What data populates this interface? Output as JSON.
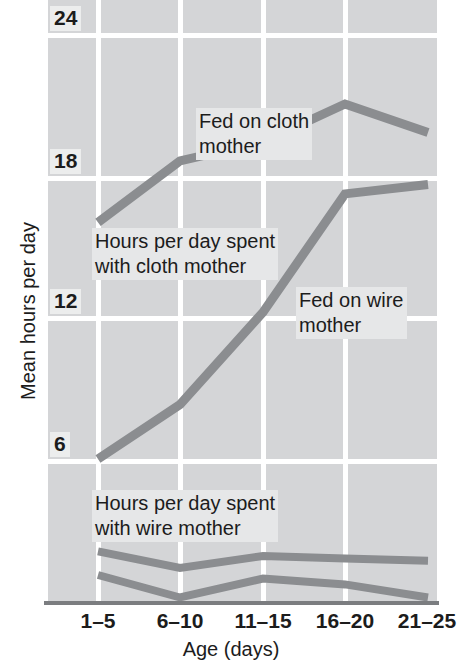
{
  "chart_data": {
    "type": "line",
    "title": "",
    "xlabel": "Age (days)",
    "ylabel": "Mean hours per day",
    "categories": [
      "1–5",
      "6–10",
      "11–15",
      "16–20",
      "21–25"
    ],
    "yticks": [
      24,
      18,
      12,
      6
    ],
    "ylim": [
      0,
      25.9
    ],
    "grid": true,
    "legend_position": "inline-annotations",
    "series": [
      {
        "name": "Hours per day spent with cloth mother — fed on cloth mother",
        "values": [
          16.0,
          18.6,
          19.4,
          21.0,
          19.8
        ],
        "color": "#8b8d90"
      },
      {
        "name": "Hours per day spent with cloth mother — fed on wire mother",
        "values": [
          6.0,
          8.3,
          12.2,
          17.2,
          17.6
        ],
        "color": "#8b8d90"
      },
      {
        "name": "Hours per day spent with wire mother — fed on wire mother",
        "values": [
          2.1,
          1.4,
          1.9,
          1.8,
          1.7
        ],
        "color": "#8b8d90"
      },
      {
        "name": "Hours per day spent with wire mother — fed on cloth mother",
        "values": [
          1.1,
          0.15,
          0.95,
          0.7,
          0.15
        ],
        "color": "#8b8d90"
      }
    ],
    "annotations": [
      {
        "id": "fed-cloth",
        "text": "Fed on cloth\nmother"
      },
      {
        "id": "hours-cloth",
        "text": "Hours per day spent\nwith cloth mother"
      },
      {
        "id": "fed-wire",
        "text": "Fed on wire\nmother"
      },
      {
        "id": "hours-wire",
        "text": "Hours per day spent\nwith wire mother"
      }
    ]
  },
  "axes": {
    "y_title": "Mean hours per day",
    "x_title": "Age (days)",
    "y_tick_labels": [
      "24",
      "18",
      "12",
      "6"
    ],
    "x_tick_labels": [
      "1–5",
      "6–10",
      "11–15",
      "16–20",
      "21–25"
    ]
  },
  "annotations": {
    "fed_on_cloth_line1": "Fed on cloth",
    "fed_on_cloth_line2": "mother",
    "hours_cloth_line1": "Hours per day spent",
    "hours_cloth_line2": "with cloth mother",
    "fed_on_wire_line1": "Fed on wire",
    "fed_on_wire_line2": "mother",
    "hours_wire_line1": "Hours per day spent",
    "hours_wire_line2": "with wire mother"
  },
  "colors": {
    "plot_background": "#d4d5d7",
    "gridline": "#ffffff",
    "series_line": "#8b8d90",
    "axis_line": "#7b7d80",
    "text": "#1c1c1c",
    "page_background": "#ffffff"
  }
}
